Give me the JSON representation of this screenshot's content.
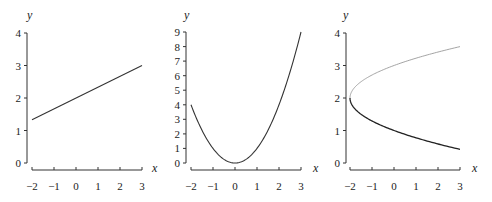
{
  "chart_data": [
    {
      "type": "line",
      "title": "",
      "xlabel": "x",
      "ylabel": "y",
      "xlim": [
        -2,
        3
      ],
      "ylim": [
        0,
        4
      ],
      "x_ticks": [
        "−2",
        "−1",
        "0",
        "1",
        "2",
        "3"
      ],
      "y_ticks": [
        "0",
        "1",
        "2",
        "3",
        "4"
      ],
      "grid": false,
      "series": [
        {
          "name": "y = x/3 + 2",
          "color": "#333333",
          "x": [
            -2,
            3
          ],
          "y": [
            1.333,
            3
          ]
        }
      ]
    },
    {
      "type": "line",
      "title": "",
      "xlabel": "x",
      "ylabel": "y",
      "xlim": [
        -2,
        3
      ],
      "ylim": [
        0,
        9
      ],
      "x_ticks": [
        "−2",
        "−1",
        "0",
        "1",
        "2",
        "3"
      ],
      "y_ticks": [
        "0",
        "1",
        "2",
        "3",
        "4",
        "5",
        "6",
        "7",
        "8",
        "9"
      ],
      "grid": false,
      "series": [
        {
          "name": "y = x^2",
          "color": "#333333",
          "x": [
            -2,
            -1.5,
            -1,
            -0.5,
            0,
            0.5,
            1,
            1.5,
            2,
            2.5,
            3
          ],
          "y": [
            4,
            2.25,
            1,
            0.25,
            0,
            0.25,
            1,
            2.25,
            4,
            6.25,
            9
          ]
        }
      ]
    },
    {
      "type": "line",
      "title": "",
      "xlabel": "x",
      "ylabel": "y",
      "xlim": [
        -2,
        3
      ],
      "ylim": [
        0,
        4
      ],
      "x_ticks": [
        "−2",
        "−1",
        "0",
        "1",
        "2",
        "3"
      ],
      "y_ticks": [
        "0",
        "1",
        "2",
        "3",
        "4"
      ],
      "grid": false,
      "series": [
        {
          "name": "upper branch y = 2 + sqrt((x+2)/2)",
          "color": "#999999",
          "x": [
            -2,
            -1.5,
            -1,
            0,
            1,
            2,
            3
          ],
          "y": [
            2,
            2.5,
            2.71,
            3,
            3.22,
            3.41,
            3.58
          ]
        },
        {
          "name": "lower branch y = 2 - sqrt((x+2)/2)",
          "color": "#222222",
          "x": [
            -2,
            -1.5,
            -1,
            0,
            1,
            2,
            3
          ],
          "y": [
            2,
            1.5,
            1.29,
            1,
            0.78,
            0.59,
            0.42
          ]
        }
      ]
    }
  ]
}
